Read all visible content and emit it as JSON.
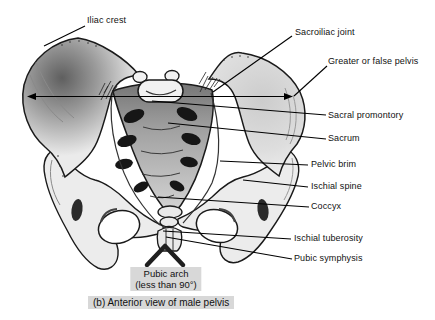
{
  "figure": {
    "type": "anatomical-line-diagram",
    "subject": "Anterior view of male pelvis",
    "caption": "(b) Anterior view of male pelvis",
    "labels": {
      "iliac_crest": "Iliac crest",
      "sacroiliac_joint": "Sacroiliac joint",
      "greater_or_false_pelvis": "Greater or false pelvis",
      "sacral_promontory": "Sacral promontory",
      "sacrum": "Sacrum",
      "pelvic_brim": "Pelvic brim",
      "ischial_spine": "Ischial spine",
      "coccyx": "Coccyx",
      "ischial_tuberosity": "Ischial tuberosity",
      "pubic_symphysis": "Pubic symphysis"
    },
    "annotation": {
      "pubic_arch_line1": "Pubic arch",
      "pubic_arch_line2": "(less than 90°)"
    },
    "colors": {
      "background": "#ffffff",
      "line_and_text": "#111111",
      "highlight_box": "#d8d8d8",
      "bone_light": "#efefef",
      "bone_shadow": "#5f5f5f",
      "sacrum_top": "#787878",
      "foramen_dark": "#161616"
    }
  }
}
